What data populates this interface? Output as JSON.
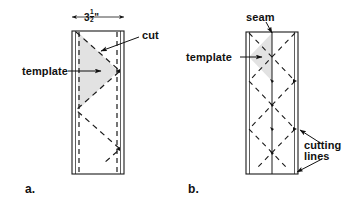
{
  "figure": {
    "background_color": "#ffffff",
    "line_color": "#1a1a1a",
    "shade_color": "#e2e2e2",
    "panels": [
      {
        "key": "a",
        "letter": "a.",
        "dimension": {
          "value_whole": "3",
          "value_frac_num": "1",
          "value_frac_den": "2",
          "unit": "\"",
          "text": "3½\""
        },
        "labels": [
          {
            "name": "template",
            "text": "template"
          },
          {
            "name": "cut",
            "text": "cut"
          }
        ]
      },
      {
        "key": "b",
        "letter": "b.",
        "labels": [
          {
            "name": "seam",
            "text": "seam"
          },
          {
            "name": "template",
            "text": "template"
          },
          {
            "name": "cutting-lines-1",
            "text": "cutting"
          },
          {
            "name": "cutting-lines-2",
            "text": "lines"
          }
        ]
      }
    ]
  }
}
